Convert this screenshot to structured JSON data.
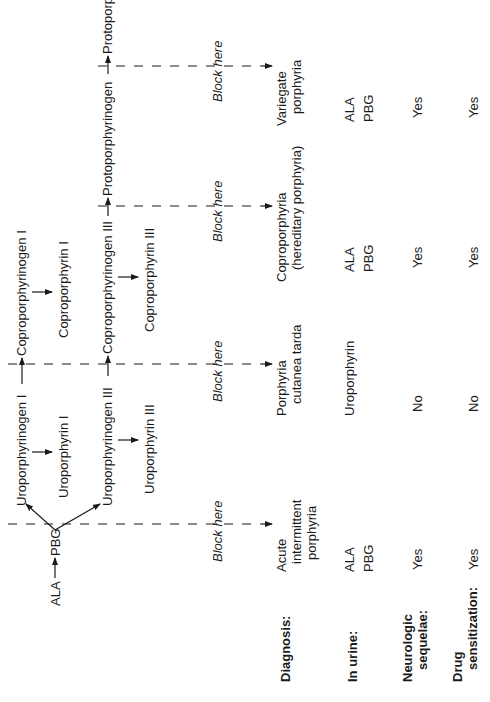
{
  "figure": {
    "orientation": "rotated 90 degrees counter-clockwise",
    "pathway": {
      "start": "ALA",
      "intermediate": "PBG",
      "series_I": {
        "uroporphyrinogen": "Uroporphyrinogen I",
        "uroporphyrin": "Uroporphyrin I",
        "coproporphyrinogen": "Coproporphyrinogen I",
        "coproporphyrin": "Coproporphyrin I"
      },
      "series_III": {
        "uroporphyrinogen": "Uroporphyrinogen III",
        "uroporphyrin": "Uroporphyrin III",
        "coproporphyrinogen": "Coproporphyrinogen III",
        "coproporphyrin": "Coproporphyrin III",
        "protoporphyrinogen": "Protoporphyrinogen",
        "protoporphyrin": "Protoporphyrin"
      }
    },
    "block_label": "Block here",
    "row_labels": {
      "diagnosis": "Diagnosis:",
      "urine": "In urine:",
      "neuro_1": "Neurologic",
      "neuro_2": "sequelae:",
      "drug_1": "Drug",
      "drug_2": "sensitization:"
    },
    "columns": [
      {
        "diagnosis_1": "Acute",
        "diagnosis_2": "intermittent",
        "diagnosis_3": "porphyria",
        "urine_1": "ALA",
        "urine_2": "PBG",
        "neurologic_sequelae": "Yes",
        "drug_sensitization": "Yes"
      },
      {
        "diagnosis_1": "Porphyria",
        "diagnosis_2": "cutanea tarda",
        "urine_1": "Uroporphyrin",
        "neurologic_sequelae": "No",
        "drug_sensitization": "No"
      },
      {
        "diagnosis_1": "Coproporphyria",
        "diagnosis_2": "(hereditary porphyria)",
        "urine_1": "ALA",
        "urine_2": "PBG",
        "neurologic_sequelae": "Yes",
        "drug_sensitization": "Yes"
      },
      {
        "diagnosis_1": "Variegate",
        "diagnosis_2": "porphyria",
        "urine_1": "ALA",
        "urine_2": "PBG",
        "neurologic_sequelae": "Yes",
        "drug_sensitization": "Yes"
      }
    ]
  }
}
